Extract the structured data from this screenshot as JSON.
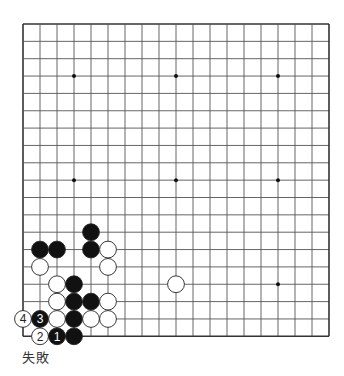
{
  "diagram": {
    "type": "go-board",
    "size": 19,
    "origin": {
      "x": 23,
      "y": 24
    },
    "spacing": {
      "x": 17.0,
      "y": 17.35
    },
    "colors": {
      "line": "#555555",
      "border": "#333333",
      "black": "#111111",
      "white": "#ffffff",
      "star": "#111111"
    },
    "star_points": [
      [
        3,
        3
      ],
      [
        9,
        3
      ],
      [
        15,
        3
      ],
      [
        3,
        9
      ],
      [
        9,
        9
      ],
      [
        15,
        9
      ],
      [
        3,
        15
      ],
      [
        9,
        15
      ],
      [
        15,
        15
      ]
    ],
    "stones": [
      {
        "col": 4,
        "row": 12,
        "color": "black"
      },
      {
        "col": 1,
        "row": 13,
        "color": "black"
      },
      {
        "col": 2,
        "row": 13,
        "color": "black"
      },
      {
        "col": 4,
        "row": 13,
        "color": "black"
      },
      {
        "col": 5,
        "row": 13,
        "color": "white"
      },
      {
        "col": 1,
        "row": 14,
        "color": "white"
      },
      {
        "col": 5,
        "row": 14,
        "color": "white"
      },
      {
        "col": 2,
        "row": 15,
        "color": "white"
      },
      {
        "col": 3,
        "row": 15,
        "color": "black"
      },
      {
        "col": 9,
        "row": 15,
        "color": "white"
      },
      {
        "col": 2,
        "row": 16,
        "color": "white"
      },
      {
        "col": 3,
        "row": 16,
        "color": "black"
      },
      {
        "col": 4,
        "row": 16,
        "color": "black"
      },
      {
        "col": 5,
        "row": 16,
        "color": "white"
      },
      {
        "col": 0,
        "row": 17,
        "color": "white",
        "label": "4"
      },
      {
        "col": 1,
        "row": 17,
        "color": "black",
        "label": "3"
      },
      {
        "col": 2,
        "row": 17,
        "color": "white"
      },
      {
        "col": 3,
        "row": 17,
        "color": "black"
      },
      {
        "col": 4,
        "row": 17,
        "color": "white"
      },
      {
        "col": 5,
        "row": 17,
        "color": "white"
      },
      {
        "col": 1,
        "row": 18,
        "color": "white",
        "label": "2"
      },
      {
        "col": 2,
        "row": 18,
        "color": "black",
        "label": "1"
      },
      {
        "col": 3,
        "row": 18,
        "color": "black"
      }
    ]
  },
  "caption": "失敗"
}
